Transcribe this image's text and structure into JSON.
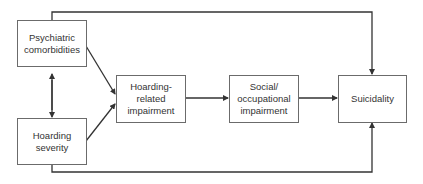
{
  "diagram": {
    "nodes": [
      {
        "id": "psychiatric",
        "label": "Psychiatric\ncomorbidities"
      },
      {
        "id": "severity",
        "label": "Hoarding\nseverity"
      },
      {
        "id": "hoarding_impairment",
        "label": "Hoarding-\nrelated\nimpairment"
      },
      {
        "id": "social_impairment",
        "label": "Social/\noccupational\nimpairment"
      },
      {
        "id": "suicidality",
        "label": "Suicidality"
      }
    ],
    "edges": [
      {
        "from": "psychiatric",
        "to": "severity",
        "type": "bidirectional"
      },
      {
        "from": "psychiatric",
        "to": "hoarding_impairment",
        "type": "directed"
      },
      {
        "from": "severity",
        "to": "hoarding_impairment",
        "type": "directed"
      },
      {
        "from": "hoarding_impairment",
        "to": "social_impairment",
        "type": "directed"
      },
      {
        "from": "social_impairment",
        "to": "suicidality",
        "type": "directed"
      },
      {
        "from": "psychiatric",
        "to": "suicidality",
        "type": "directed",
        "route": "top"
      },
      {
        "from": "severity",
        "to": "suicidality",
        "type": "directed",
        "route": "bottom"
      }
    ],
    "colors": {
      "line": "#333333",
      "box_border": "#6b6b6b",
      "text": "#333333"
    }
  }
}
